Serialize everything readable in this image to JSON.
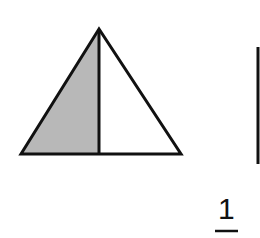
{
  "figure": {
    "shape": "triangle",
    "parts": 2,
    "shaded_parts": 1,
    "shaded_color": "#b8b8b8",
    "stroke_color": "#111111"
  },
  "fraction": {
    "numerator": "1"
  }
}
